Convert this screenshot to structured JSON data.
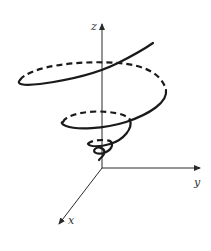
{
  "figure": {
    "type": "conical helix in 3D coordinate axes",
    "axes": {
      "z": {
        "label": "z"
      },
      "y": {
        "label": "y"
      },
      "x": {
        "label": "x"
      }
    },
    "curve": {
      "description": "spiral winding around z-axis, radius increasing with height",
      "front_style": "solid",
      "back_style": "dashed"
    },
    "colors": {
      "background": "#ffffff",
      "ink": "#1a1a1a"
    }
  }
}
